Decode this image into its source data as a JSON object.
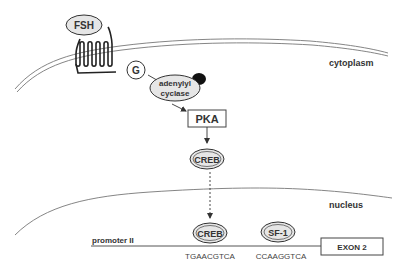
{
  "diagram": {
    "regions": {
      "cytoplasm": "cytoplasm",
      "nucleus": "nucleus"
    },
    "nodes": {
      "fsh": "FSH",
      "g_protein": "G",
      "adenylyl_cyclase_line1": "adenylyl",
      "adenylyl_cyclase_line2": "cyclase",
      "pka": "PKA",
      "creb_cyto": "CREB",
      "creb_nuc": "CREB",
      "sf1": "SF-1",
      "exon2": "EXON 2"
    },
    "promoter": {
      "label": "promoter II",
      "creb_site": "TGAACGTCA",
      "sf1_site": "CCAAGGTCA"
    },
    "edges": [
      {
        "from": "G",
        "to": "adenylyl cyclase",
        "style": "solid"
      },
      {
        "from": "adenylyl cyclase",
        "to": "PKA",
        "style": "solid"
      },
      {
        "from": "PKA",
        "to": "CREB",
        "style": "solid"
      },
      {
        "from": "CREB (cytoplasm)",
        "to": "CREB (nucleus)",
        "style": "dashed"
      }
    ],
    "colors": {
      "stroke": "#333333",
      "node_fill": "#e6e6e6",
      "membrane": "#777777",
      "activator_blob": "#111111"
    }
  }
}
